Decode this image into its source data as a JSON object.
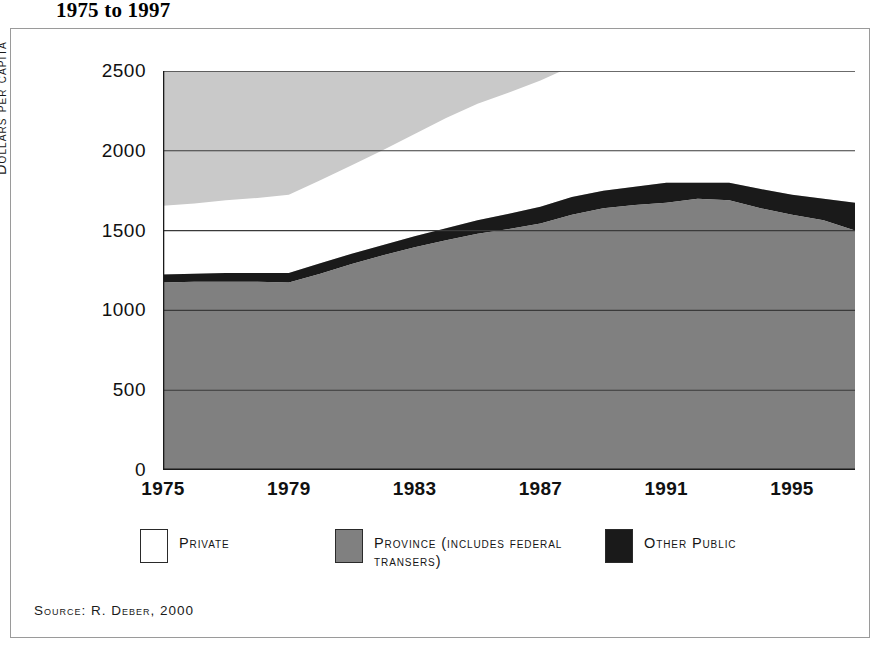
{
  "figure": {
    "title": "1975 to 1997",
    "source": "Source: R. Deber, 2000"
  },
  "colors": {
    "private": "#ffffff",
    "province": "#808080",
    "other_public": "#1a1a1a",
    "plot_background": "#c9c9c9",
    "axis": "#1a1a1a",
    "gridline": "#3a3a3a",
    "frame": "#9a9a9a"
  },
  "legend": {
    "position": "bottom",
    "items": [
      {
        "label": "Private",
        "color": "#ffffff",
        "swatch_name": "legend-swatch-private"
      },
      {
        "label": "Province (includes federal transers)",
        "color": "#808080",
        "swatch_name": "legend-swatch-province"
      },
      {
        "label": "Other Public",
        "color": "#1a1a1a",
        "swatch_name": "legend-swatch-other-public"
      }
    ]
  },
  "axes": {
    "y": {
      "title": "Dollars per capita",
      "ticks": [
        0,
        500,
        1000,
        1500,
        2000,
        2500
      ],
      "tick_labels": [
        "0",
        "500",
        "1000",
        "1500",
        "2000",
        "2500"
      ],
      "min": 0,
      "max": 2500
    },
    "x": {
      "title": "",
      "ticks": [
        1975,
        1979,
        1983,
        1987,
        1991,
        1995
      ],
      "tick_labels": [
        "1975",
        "1979",
        "1983",
        "1987",
        "1991",
        "1995"
      ],
      "min": 1975,
      "max": 1997
    }
  },
  "chart_data": {
    "type": "area",
    "stacked": true,
    "title": "1975 to 1997",
    "subtitle": "",
    "xlabel": "",
    "ylabel": "Dollars per capita",
    "xlim": [
      1975,
      1997
    ],
    "ylim": [
      0,
      2500
    ],
    "grid": true,
    "legend_position": "bottom",
    "x": [
      1975,
      1976,
      1977,
      1978,
      1979,
      1980,
      1981,
      1982,
      1983,
      1984,
      1985,
      1986,
      1987,
      1988,
      1989,
      1990,
      1991,
      1992,
      1993,
      1994,
      1995,
      1996,
      1997
    ],
    "series": [
      {
        "name": "Province (includes federal transers)",
        "color": "#808080",
        "values": [
          1175,
          1180,
          1180,
          1180,
          1175,
          1230,
          1290,
          1345,
          1395,
          1440,
          1480,
          1510,
          1545,
          1600,
          1640,
          1660,
          1675,
          1700,
          1690,
          1640,
          1600,
          1565,
          1500
        ]
      },
      {
        "name": "Other Public",
        "color": "#1a1a1a",
        "values": [
          50,
          50,
          55,
          55,
          60,
          65,
          65,
          65,
          70,
          75,
          85,
          95,
          105,
          110,
          110,
          115,
          125,
          100,
          110,
          120,
          125,
          135,
          175
        ]
      },
      {
        "name": "Private",
        "color": "#ffffff",
        "values": [
          430,
          440,
          455,
          470,
          490,
          520,
          555,
          595,
          640,
          690,
          730,
          760,
          790,
          820,
          860,
          905,
          1000,
          1060,
          1090,
          1120,
          1150,
          1180,
          1200
        ]
      }
    ],
    "totals": [
      1655,
      1670,
      1690,
      1705,
      1725,
      1815,
      1910,
      2005,
      2105,
      2205,
      2295,
      2365,
      2440,
      2530,
      2610,
      2680,
      2800,
      2860,
      2890,
      2880,
      2875,
      2880,
      2875
    ]
  }
}
